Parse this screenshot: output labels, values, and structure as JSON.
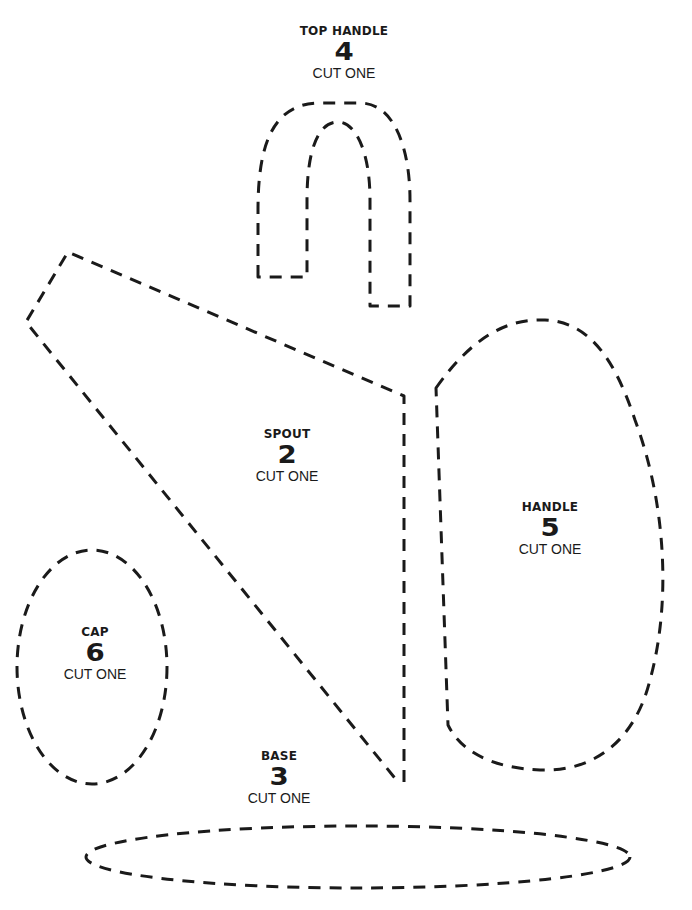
{
  "pieces": [
    {
      "id": "top-handle",
      "name": "TOP HANDLE",
      "number": "4",
      "quantity": "CUT ONE"
    },
    {
      "id": "spout",
      "name": "SPOUT",
      "number": "2",
      "quantity": "CUT ONE"
    },
    {
      "id": "base",
      "name": "BASE",
      "number": "3",
      "quantity": "CUT ONE"
    },
    {
      "id": "handle",
      "name": "HANDLE",
      "number": "5",
      "quantity": "CUT ONE"
    },
    {
      "id": "cap",
      "name": "CAP",
      "number": "6",
      "quantity": "CUT ONE"
    }
  ],
  "style": {
    "line_color": "#1a1a1a",
    "background": "#ffffff"
  }
}
